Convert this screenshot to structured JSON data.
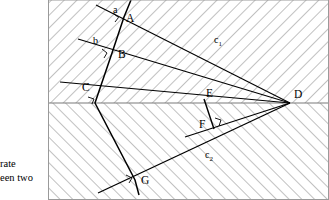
{
  "figure": {
    "caption_lines": [
      "rate",
      "een two"
    ],
    "frame": {
      "x": 48,
      "y": 0,
      "width": 281,
      "height": 200,
      "border_color": "#6f6f6f"
    },
    "hatching": {
      "upper_direction": "backslash",
      "lower_direction": "slash",
      "color": "#8c8c8c",
      "spacing_px": 9
    },
    "axis": {
      "name": "horizontal-boundary-line",
      "y": 103,
      "x_start": 48,
      "x_end": 329,
      "color": "#808080"
    },
    "points": [
      {
        "id": "A",
        "label": "A",
        "x": 124,
        "y": 17,
        "right_angle": true
      },
      {
        "id": "B",
        "label": "B",
        "x": 112,
        "y": 53,
        "right_angle": true
      },
      {
        "id": "C",
        "label": "C",
        "x": 95,
        "y": 103,
        "right_angle": true
      },
      {
        "id": "D",
        "label": "D",
        "x": 290,
        "y": 103,
        "right_angle": false
      },
      {
        "id": "E",
        "label": "E",
        "x": 204,
        "y": 99,
        "right_angle": false
      },
      {
        "id": "F",
        "label": "F",
        "x": 208,
        "y": 124,
        "right_angle": true
      },
      {
        "id": "G",
        "label": "G",
        "x": 135,
        "y": 180,
        "right_angle": true
      }
    ],
    "line_labels": [
      {
        "id": "a",
        "base": "a",
        "sub": "",
        "x": 114,
        "y": 13
      },
      {
        "id": "b",
        "base": "b",
        "sub": "",
        "x": 96,
        "y": 43
      },
      {
        "id": "c1",
        "base": "c",
        "sub": "1",
        "x": 215,
        "y": 42
      },
      {
        "id": "c2",
        "base": "c",
        "sub": "2",
        "x": 206,
        "y": 158
      }
    ],
    "rays": [
      {
        "id": "a",
        "name": "ray-a",
        "x1": 96,
        "y1": 5,
        "x2": 290,
        "y2": 103
      },
      {
        "id": "b",
        "name": "ray-b",
        "x1": 78,
        "y1": 39,
        "x2": 290,
        "y2": 103
      },
      {
        "id": "c1",
        "name": "ray-c1",
        "x1": 60,
        "y1": 82,
        "x2": 290,
        "y2": 103
      },
      {
        "id": "c2",
        "name": "ray-c2",
        "x1": 290,
        "y1": 103,
        "x2": 98,
        "y2": 193
      },
      {
        "id": "f-seg",
        "name": "segment-f-perp",
        "x1": 290,
        "y1": 103,
        "x2": 190,
        "y2": 136
      }
    ],
    "polyline_ABCG": {
      "name": "broken-line-a-b-c-g",
      "points": "131,0 124,17 112,53 95,103 135,180 139,195"
    },
    "segment_EF": {
      "name": "segment-e-f",
      "x1": 204,
      "y1": 99,
      "x2": 214,
      "y2": 129
    }
  }
}
